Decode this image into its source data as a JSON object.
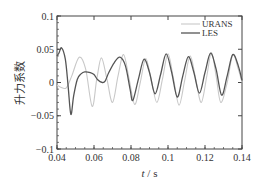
{
  "chart_data": {
    "type": "line",
    "title": "",
    "xlabel_italic": "t",
    "xlabel_rest": " / s",
    "ylabel": "升力系数",
    "xlim": [
      0.04,
      0.14
    ],
    "ylim": [
      -0.1,
      0.1
    ],
    "xticks": [
      0.04,
      0.06,
      0.08,
      0.1,
      0.12,
      0.14
    ],
    "xtick_labels": [
      "0.04",
      "0.06",
      "0.08",
      "0.1",
      "0.12",
      "0.14"
    ],
    "yticks": [
      -0.1,
      -0.05,
      0,
      0.05,
      0.1
    ],
    "ytick_labels": [
      "−0.1",
      "−0.05",
      "0",
      "0.05",
      "0.1"
    ],
    "grid": false,
    "legend_position": "top-right",
    "series": [
      {
        "name": "URANS",
        "color": "#c8c8c8",
        "x": [
          0.04,
          0.042,
          0.045,
          0.048,
          0.052,
          0.0555,
          0.059,
          0.0615,
          0.064,
          0.067,
          0.07,
          0.073,
          0.076,
          0.079,
          0.082,
          0.085,
          0.088,
          0.091,
          0.094,
          0.097,
          0.1,
          0.103,
          0.106,
          0.109,
          0.112,
          0.115,
          0.118,
          0.121,
          0.1235,
          0.126,
          0.1285,
          0.132,
          0.135,
          0.138,
          0.14
        ],
        "y": [
          -0.004,
          -0.007,
          -0.008,
          0.01,
          0.038,
          0.02,
          -0.036,
          0.005,
          0.037,
          0.005,
          -0.03,
          0.01,
          0.042,
          0.005,
          -0.033,
          0.0,
          0.036,
          0.003,
          -0.03,
          0.005,
          0.043,
          0.005,
          -0.034,
          0.003,
          0.04,
          0.005,
          -0.03,
          0.01,
          0.045,
          0.01,
          -0.03,
          0.0,
          0.042,
          0.02,
          0.0
        ]
      },
      {
        "name": "LES",
        "color": "#555555",
        "x": [
          0.04,
          0.041,
          0.0425,
          0.0445,
          0.046,
          0.0475,
          0.049,
          0.051,
          0.053,
          0.055,
          0.058,
          0.06,
          0.062,
          0.0645,
          0.066,
          0.068,
          0.071,
          0.074,
          0.077,
          0.0795,
          0.081,
          0.084,
          0.087,
          0.09,
          0.093,
          0.096,
          0.099,
          0.102,
          0.105,
          0.108,
          0.111,
          0.114,
          0.117,
          0.12,
          0.123,
          0.126,
          0.129,
          0.132,
          0.135,
          0.138,
          0.14
        ],
        "y": [
          0.04,
          0.044,
          0.052,
          0.035,
          -0.005,
          -0.048,
          -0.02,
          0.005,
          0.013,
          0.016,
          0.015,
          0.012,
          0.004,
          0.0,
          0.002,
          0.015,
          0.03,
          0.038,
          0.025,
          -0.01,
          -0.027,
          0.005,
          0.035,
          0.015,
          -0.017,
          0.012,
          0.043,
          0.015,
          -0.022,
          0.01,
          0.039,
          0.015,
          -0.016,
          0.015,
          0.044,
          0.02,
          -0.019,
          0.01,
          0.042,
          0.025,
          0.003
        ]
      }
    ]
  }
}
